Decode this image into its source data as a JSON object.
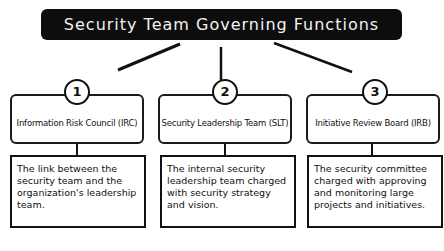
{
  "title": "Security Team  Governing Functions",
  "functions": [
    {
      "number": "1",
      "name": "Information Risk Council (IRC)",
      "description": "The link between the security team and the organization's leadership team."
    },
    {
      "number": "2",
      "name": "Security Leadership Team (SLT)",
      "description": "The internal security leadership team charged with security strategy and vision."
    },
    {
      "number": "3",
      "name": "Initiative Review Board (IRB)",
      "description": "The security committee charged with approving and monitoring large projects and initiatives."
    }
  ]
}
